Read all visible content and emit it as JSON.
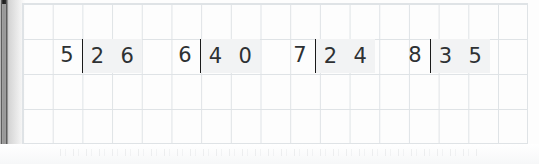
{
  "worksheet": {
    "title": "Long Division Practice Problems",
    "grid": {
      "cell_width_px": 29.7,
      "cell_height_px": 35,
      "line_color": "#dfe3e6",
      "visible": true
    },
    "colors": {
      "ink": "#2e3133",
      "bracket": "#1a1a1a",
      "cell_highlight": "#f2f3f4",
      "paper": "#fdfdfd",
      "grid_line": "#dfe3e6",
      "spine": "#1c1c1c"
    }
  },
  "problems": [
    {
      "id": "problem-1",
      "divisor": "5",
      "dividend_digits": [
        "2",
        "6"
      ],
      "dividend": "26",
      "expression": "26 ÷ 5",
      "left_px": 52
    },
    {
      "id": "problem-2",
      "divisor": "6",
      "dividend_digits": [
        "4",
        "0"
      ],
      "dividend": "40",
      "expression": "40 ÷ 6",
      "left_px": 170
    },
    {
      "id": "problem-3",
      "divisor": "7",
      "dividend_digits": [
        "2",
        "4"
      ],
      "dividend": "24",
      "expression": "24 ÷ 7",
      "left_px": 285
    },
    {
      "id": "problem-4",
      "divisor": "8",
      "dividend_digits": [
        "3",
        "5"
      ],
      "dividend": "35",
      "expression": "35 ÷ 8",
      "left_px": 400
    }
  ]
}
